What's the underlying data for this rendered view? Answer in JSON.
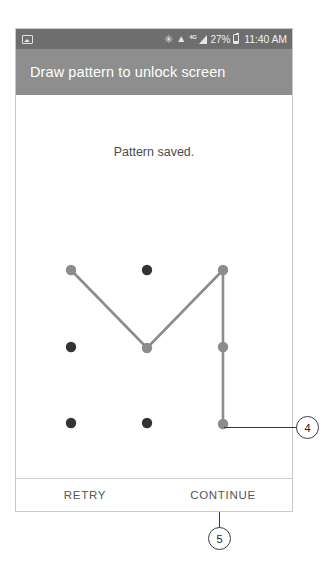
{
  "device": {
    "status_bar": {
      "left_icons": [
        "photo-icon"
      ],
      "right_icons": [
        "bluetooth-icon",
        "wifi-icon",
        "lte-icon",
        "signal-icon",
        "battery-icon"
      ],
      "bluetooth_glyph": "✳",
      "wifi_glyph": "▲",
      "lte_label": "4G",
      "battery_percent": "27%",
      "time": "11:40 AM",
      "background_color": "#6e6e6e"
    },
    "header": {
      "title": "Draw pattern to unlock screen",
      "background_color": "#8e8e8e",
      "text_color": "#ffffff"
    },
    "content": {
      "status_message": "Pattern saved."
    },
    "action_bar": {
      "buttons": [
        {
          "label": "RETRY",
          "name": "retry-button"
        },
        {
          "label": "CONTINUE",
          "name": "continue-button"
        }
      ]
    }
  },
  "pattern": {
    "grid_rows": 3,
    "grid_cols": 3,
    "dot_inactive_color": "#333333",
    "dot_active_color": "#8c8c8c",
    "trace_color": "#8c8c8c",
    "dots": [
      {
        "id": "r0c0",
        "row": 0,
        "col": 0,
        "cx": 71,
        "cy": 269,
        "active": true
      },
      {
        "id": "r0c1",
        "row": 0,
        "col": 1,
        "cx": 147,
        "cy": 269,
        "active": false
      },
      {
        "id": "r0c2",
        "row": 0,
        "col": 2,
        "cx": 223,
        "cy": 269,
        "active": true
      },
      {
        "id": "r1c0",
        "row": 1,
        "col": 0,
        "cx": 71,
        "cy": 346,
        "active": false
      },
      {
        "id": "r1c1",
        "row": 1,
        "col": 1,
        "cx": 147,
        "cy": 347,
        "active": true
      },
      {
        "id": "r1c2",
        "row": 1,
        "col": 2,
        "cx": 223,
        "cy": 346,
        "active": true
      },
      {
        "id": "r2c0",
        "row": 2,
        "col": 0,
        "cx": 71,
        "cy": 422,
        "active": false
      },
      {
        "id": "r2c1",
        "row": 2,
        "col": 1,
        "cx": 147,
        "cy": 422,
        "active": false
      },
      {
        "id": "r2c2",
        "row": 2,
        "col": 2,
        "cx": 223,
        "cy": 423,
        "active": true
      }
    ],
    "trace_sequence": [
      "r0c0",
      "r1c1",
      "r0c2",
      "r1c2",
      "r2c2"
    ]
  },
  "annotations": [
    {
      "number": "4",
      "name": "callout-4",
      "target": "pattern-bottom-right-dot"
    },
    {
      "number": "5",
      "name": "callout-5",
      "target": "continue-button"
    }
  ]
}
